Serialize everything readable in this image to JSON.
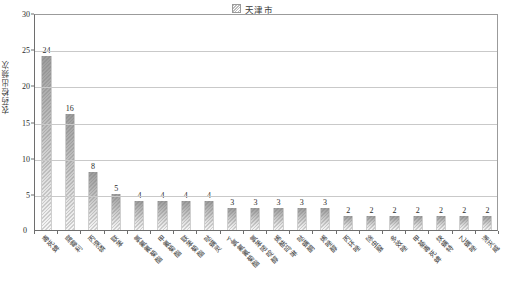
{
  "chart_data": {
    "type": "bar",
    "title": "",
    "xlabel": "",
    "ylabel": "农药检出频次",
    "ylim": [
      0,
      30
    ],
    "yticks": [
      0,
      5,
      10,
      15,
      20,
      25,
      30
    ],
    "grid": true,
    "legend_position": "top-center",
    "legend": [
      "天津市"
    ],
    "categories": [
      "毒死蜱",
      "腐霉利",
      "丙溴磷",
      "联苯",
      "氯氟氰菊酯",
      "甲氰菊酯",
      "联苯菊酯",
      "哒螨灵",
      "γ-氯氟氰菊酯",
      "氯苯嘧啶醇",
      "烯酰吗啉",
      "哒螨酮",
      "烯唑醇",
      "丙环唑",
      "除虫脲",
      "多效唑",
      "甲基毒死蜱",
      "炔螨特",
      "乙螨唑",
      "涕灭威"
    ],
    "values": [
      24,
      16,
      8,
      5,
      4,
      4,
      4,
      4,
      3,
      3,
      3,
      3,
      3,
      2,
      2,
      2,
      2,
      2,
      2,
      2
    ],
    "series": [
      {
        "name": "天津市",
        "values": [
          24,
          16,
          8,
          5,
          4,
          4,
          4,
          4,
          3,
          3,
          3,
          3,
          3,
          2,
          2,
          2,
          2,
          2,
          2,
          2
        ]
      }
    ],
    "colors": {
      "bar_top": "#9d9d9d",
      "bar_bottom": "#f6f6f6",
      "grid": "#c9c9c9",
      "axis": "#6e6e6e",
      "text": "#2b2b2b"
    }
  }
}
